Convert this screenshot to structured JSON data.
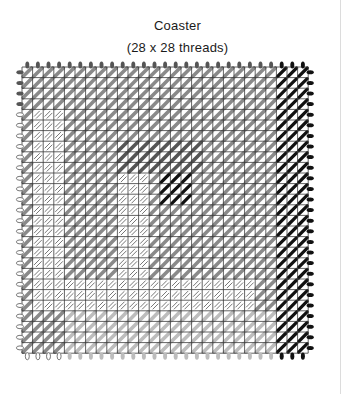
{
  "title": "Coaster",
  "subtitle": "(28 x 28 threads)",
  "chart": {
    "threads_x": 28,
    "threads_y": 28,
    "grid": {
      "left": 22,
      "top": 67,
      "cell": 10.6,
      "cols": 27,
      "rows": 27,
      "line_color": "#3a3a3a"
    },
    "colors": {
      "black": "#111111",
      "dark_gray": "#555555",
      "mid_gray": "#8a8a8a",
      "light_gray": "#bdbdbd",
      "outline_gray": "#777777"
    },
    "regions": [
      {
        "name": "outer-frame-top",
        "style": "mid",
        "c0": 0,
        "r0": 0,
        "c1": 24,
        "r1": 4
      },
      {
        "name": "right-black-band",
        "style": "black",
        "c0": 24,
        "r0": 0,
        "c1": 27,
        "r1": 27
      },
      {
        "name": "left-outlined-column",
        "style": "outlined",
        "c0": 1,
        "r0": 4,
        "c1": 4,
        "r1": 23
      },
      {
        "name": "mid-frame",
        "style": "mid",
        "c0": 4,
        "r0": 4,
        "c1": 24,
        "r1": 23
      },
      {
        "name": "inner-dark-band",
        "style": "dark",
        "c0": 9,
        "r0": 7,
        "c1": 17,
        "r1": 10
      },
      {
        "name": "inner-outlined-square",
        "style": "outlined",
        "c0": 9,
        "r0": 10,
        "c1": 12,
        "r1": 20
      },
      {
        "name": "center-black-square",
        "style": "black",
        "c0": 13,
        "r0": 10,
        "c1": 16,
        "r1": 13
      },
      {
        "name": "right-frame-column",
        "style": "mid",
        "c0": 21,
        "r0": 4,
        "c1": 24,
        "r1": 23
      },
      {
        "name": "outlined-bottom-strip",
        "style": "outlined",
        "c0": 4,
        "r0": 20,
        "c1": 22,
        "r1": 23
      },
      {
        "name": "bottom-light-band",
        "style": "light",
        "c0": 4,
        "r0": 23,
        "c1": 24,
        "r1": 27
      }
    ]
  }
}
